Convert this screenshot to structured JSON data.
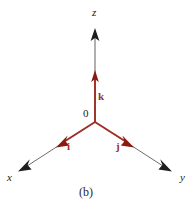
{
  "figure": {
    "caption": "(b)",
    "colors": {
      "vector_red": "#9E3026",
      "arrowhead_red": "#8B1A12",
      "axis_black": "#2b2b2b",
      "text_black": "#1a1a1a",
      "background": "#ffffff"
    },
    "origin": {
      "label": "0",
      "x": 95,
      "y": 122
    },
    "axes": [
      {
        "name": "z-axis",
        "label": "z",
        "color": "#2b2b2b",
        "from": {
          "x": 95,
          "y": 122
        },
        "to": {
          "x": 95,
          "y": 30
        },
        "arrowhead": "black",
        "label_pos": {
          "x": 95,
          "y": 12
        }
      },
      {
        "name": "x-axis",
        "label": "x",
        "color": "#2b2b2b",
        "from": {
          "x": 95,
          "y": 122
        },
        "to": {
          "x": 19,
          "y": 171
        },
        "arrowhead": "black",
        "label_pos": {
          "x": 10,
          "y": 177
        }
      },
      {
        "name": "y-axis",
        "label": "y",
        "color": "#2b2b2b",
        "from": {
          "x": 95,
          "y": 122
        },
        "to": {
          "x": 171,
          "y": 171
        },
        "arrowhead": "black",
        "label_pos": {
          "x": 183,
          "y": 177
        }
      }
    ],
    "unit_vectors": [
      {
        "name": "k-vector",
        "label": "k",
        "color": "#9E3026",
        "along": "z-axis",
        "from": {
          "x": 95,
          "y": 122
        },
        "to": {
          "x": 95,
          "y": 71
        },
        "arrowhead": "red",
        "label_pos": {
          "x": 101,
          "y": 96
        }
      },
      {
        "name": "i-vector",
        "label": "i",
        "color": "#9E3026",
        "along": "x-axis",
        "from": {
          "x": 95,
          "y": 122
        },
        "to": {
          "x": 56,
          "y": 147
        },
        "arrowhead": "red",
        "label_pos": {
          "x": 70,
          "y": 146
        }
      },
      {
        "name": "j-vector",
        "label": "j",
        "color": "#9E3026",
        "along": "y-axis",
        "from": {
          "x": 95,
          "y": 122
        },
        "to": {
          "x": 134,
          "y": 147
        },
        "arrowhead": "red",
        "label_pos": {
          "x": 119,
          "y": 146
        }
      }
    ]
  }
}
